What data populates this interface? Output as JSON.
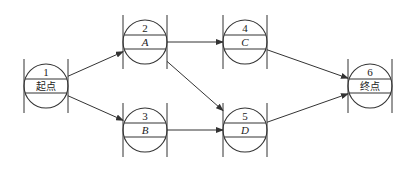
{
  "diagram": {
    "type": "network-diagram",
    "nodes": [
      {
        "id": "1",
        "number": "1",
        "label": "起点",
        "italic": false,
        "cx": 46,
        "cy": 86
      },
      {
        "id": "2",
        "number": "2",
        "label": "A",
        "italic": true,
        "cx": 145,
        "cy": 42
      },
      {
        "id": "3",
        "number": "3",
        "label": "B",
        "italic": true,
        "cx": 145,
        "cy": 130
      },
      {
        "id": "4",
        "number": "4",
        "label": "C",
        "italic": true,
        "cx": 245,
        "cy": 42
      },
      {
        "id": "5",
        "number": "5",
        "label": "D",
        "italic": true,
        "cx": 245,
        "cy": 130
      },
      {
        "id": "6",
        "number": "6",
        "label": "终点",
        "italic": false,
        "cx": 370,
        "cy": 86
      }
    ],
    "edges": [
      {
        "from": "1",
        "to": "2"
      },
      {
        "from": "1",
        "to": "3"
      },
      {
        "from": "2",
        "to": "4"
      },
      {
        "from": "2",
        "to": "5"
      },
      {
        "from": "3",
        "to": "5"
      },
      {
        "from": "4",
        "to": "6"
      },
      {
        "from": "5",
        "to": "6"
      }
    ],
    "style": {
      "line_color": "#333333",
      "node_radius": 22
    }
  }
}
